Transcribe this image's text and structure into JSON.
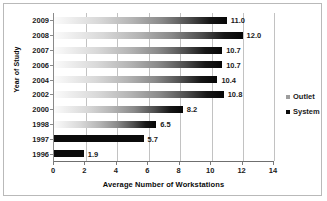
{
  "chart_data": {
    "type": "bar",
    "orientation": "horizontal",
    "title": "",
    "xlabel": "Average Number of Workstations",
    "ylabel": "Year of Study",
    "categories": [
      "2009",
      "2008",
      "2007",
      "2006",
      "2004",
      "2002",
      "2000",
      "1998",
      "1997",
      "1996"
    ],
    "values": [
      11.0,
      12.0,
      10.7,
      10.7,
      10.4,
      10.8,
      8.2,
      6.5,
      5.7,
      1.9
    ],
    "data_labels": [
      "11.0",
      "12.0",
      "10.7",
      "10.7",
      "10.4",
      "10.8",
      "8.2",
      "6.5",
      "5.7",
      "1.9"
    ],
    "bar_styles": [
      "gradient",
      "gradient",
      "gradient",
      "gradient",
      "gradient",
      "gradient",
      "gradient",
      "gradient",
      "solid",
      "solid"
    ],
    "xlim": [
      0,
      14
    ],
    "xticks": [
      "0",
      "2",
      "4",
      "6",
      "8",
      "10",
      "12",
      "14"
    ],
    "grid": "vertical",
    "legend_position": "right",
    "legend": [
      {
        "label": "Outlet",
        "color": "#9d9d9d"
      },
      {
        "label": "System",
        "color": "#0b0b0b"
      }
    ]
  },
  "colors": {
    "bar_dark": "#0b0b0b",
    "bar_light": "#fbfbfb",
    "gridline": "#c2c2c2",
    "axis": "#6f6f6f",
    "frame": "#b9b9b9",
    "text": "#1a1a1a",
    "background": "#ffffff"
  }
}
